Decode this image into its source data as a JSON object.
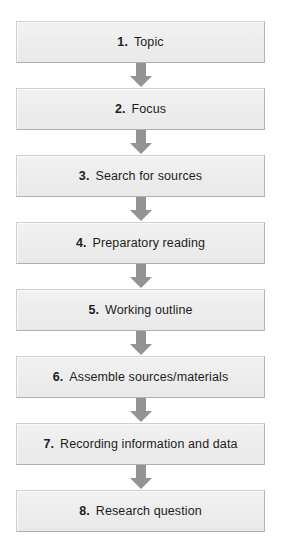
{
  "diagram": {
    "orientation": "vertical",
    "colors": {
      "box_fill": "#ededed",
      "box_border": "#cfcfcf",
      "arrow": "#939393",
      "text": "#1d1d1d",
      "background": "#ffffff"
    },
    "arrow_icon_name": "arrow-down-icon",
    "steps": [
      {
        "number": "1.",
        "label": "Topic"
      },
      {
        "number": "2.",
        "label": "Focus"
      },
      {
        "number": "3.",
        "label": "Search for sources"
      },
      {
        "number": "4.",
        "label": "Preparatory reading"
      },
      {
        "number": "5.",
        "label": "Working outline"
      },
      {
        "number": "6.",
        "label": "Assemble sources/materials"
      },
      {
        "number": "7.",
        "label": "Recording information and data"
      },
      {
        "number": "8.",
        "label": "Research question"
      }
    ]
  }
}
